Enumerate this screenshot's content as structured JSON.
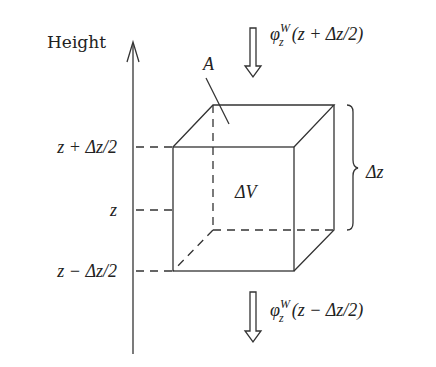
{
  "diagram": {
    "type": "control-volume-schematic",
    "axis": {
      "label": "Height",
      "direction": "up"
    },
    "levels": [
      {
        "id": "top",
        "label_main": "z + Δz/2",
        "y": 147
      },
      {
        "id": "mid",
        "label_main": "z",
        "y": 210
      },
      {
        "id": "bottom",
        "label_main": "z − Δz/2",
        "y": 271
      }
    ],
    "cube": {
      "volume_label": "ΔV",
      "area_label": "A",
      "height_label": "Δz"
    },
    "fluxes": {
      "top": {
        "symbol": "φ",
        "superscript": "W",
        "subscript": "z",
        "argument": "(z + Δz/2)",
        "direction": "down"
      },
      "bottom": {
        "symbol": "φ",
        "superscript": "W",
        "subscript": "z",
        "argument": "(z − Δz/2)",
        "direction": "down"
      }
    },
    "colors": {
      "stroke": "#333333",
      "text": "#222222",
      "background": "#ffffff"
    }
  }
}
